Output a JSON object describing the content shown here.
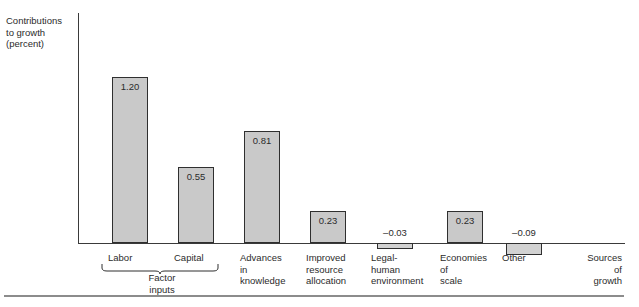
{
  "figure": {
    "clipped_title": "",
    "y_caption_lines": [
      "Contributions",
      "to growth",
      "(percent)"
    ],
    "x_caption_lines": [
      "Sources",
      "of",
      "growth"
    ],
    "group_label_lines": [
      "Factor",
      "inputs"
    ],
    "bar_fill_color": "#c9c9c9",
    "bar_border_color": "#2f2f2f",
    "axis_color": "#3a3a3a",
    "text_color": "#2b2b2b"
  },
  "chart_data": {
    "type": "bar",
    "title": "",
    "xlabel": "Sources of growth",
    "ylabel": "Contributions to growth (percent)",
    "grid": false,
    "legend": "none",
    "ylim": [
      -0.15,
      1.35
    ],
    "categories": [
      "Labor",
      "Capital",
      "Advances in knowledge",
      "Improved resource allocation",
      "Legal-human environment",
      "Economies of scale",
      "Other"
    ],
    "category_label_lines": [
      [
        "Labor"
      ],
      [
        "Capital"
      ],
      [
        "Advances",
        "in",
        "knowledge"
      ],
      [
        "Improved",
        "resource",
        "allocation"
      ],
      [
        "Legal-",
        "human",
        "environment"
      ],
      [
        "Economies",
        "of",
        "scale"
      ],
      [
        "Other"
      ]
    ],
    "values": [
      1.2,
      0.55,
      0.81,
      0.23,
      -0.03,
      0.23,
      -0.09
    ],
    "value_labels": [
      "1.20",
      "0.55",
      "0.81",
      "0.23",
      "–0.03",
      "0.23",
      "–0.09"
    ],
    "groups": [
      {
        "label": "Factor inputs",
        "members": [
          "Labor",
          "Capital"
        ]
      }
    ]
  }
}
